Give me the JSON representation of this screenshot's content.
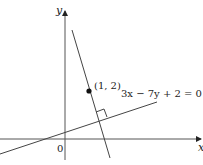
{
  "diagram": {
    "axes": {
      "x_label": "x",
      "y_label": "y",
      "origin_label": "0"
    },
    "point": {
      "label": "(1, 2)"
    },
    "line": {
      "equation_label": "3x − 7y + 2 = 0"
    },
    "colors": {
      "stroke": "#333333",
      "point": "#111111"
    }
  }
}
